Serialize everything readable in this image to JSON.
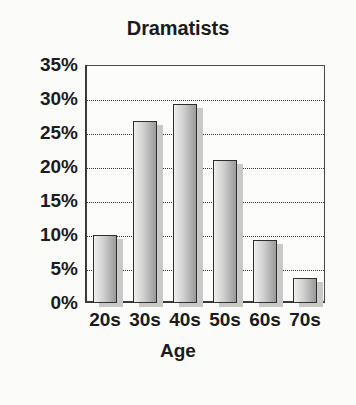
{
  "chart_data": {
    "type": "bar",
    "title": "Dramatists",
    "xlabel": "Age",
    "ylabel": "",
    "categories": [
      "20s",
      "30s",
      "40s",
      "50s",
      "60s",
      "70s"
    ],
    "values": [
      10,
      26.7,
      29.3,
      21,
      9.3,
      3.7
    ],
    "ylim": [
      0,
      35
    ],
    "ytick_labels": [
      "35%",
      "30%",
      "25%",
      "20%",
      "15%",
      "10%",
      "5%",
      "0%"
    ],
    "ytick_values": [
      35,
      30,
      25,
      20,
      15,
      10,
      5,
      0
    ],
    "grid": true,
    "legend": "none",
    "colors": {
      "bar_light": "#efefef",
      "bar_dark": "#9b9b9b",
      "bar_outline": "#2e2e2e",
      "bar_shadow": "#c9c9c9",
      "axis": "#3a3a3a",
      "grid": "#333333",
      "text": "#1b1b1b",
      "background": "#fbfbfa"
    }
  }
}
